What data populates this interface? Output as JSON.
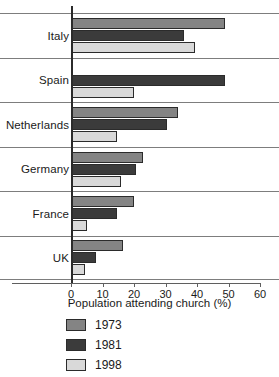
{
  "chart_data": {
    "type": "bar",
    "orientation": "horizontal",
    "title": "",
    "xlabel": "Population attending church (%)",
    "ylabel": "",
    "xlim": [
      0,
      60
    ],
    "xticks": [
      0,
      10,
      20,
      30,
      40,
      50,
      60
    ],
    "grid": false,
    "legend_position": "bottom-left",
    "categories": [
      "Italy",
      "Spain",
      "Netherlands",
      "Germany",
      "France",
      "UK"
    ],
    "series": [
      {
        "name": "1973",
        "color": "#848484",
        "values": [
          49,
          null,
          34,
          23,
          20,
          16.5
        ]
      },
      {
        "name": "1981",
        "color": "#3b3b3b",
        "values": [
          36,
          49,
          30.5,
          20.5,
          14.5,
          8
        ]
      },
      {
        "name": "1998",
        "color": "#d9d9d9",
        "values": [
          39.5,
          20,
          14.5,
          16,
          5,
          4.5
        ]
      }
    ]
  },
  "axis": {
    "title": "Population attending church (%)",
    "ticks": [
      "0",
      "10",
      "20",
      "30",
      "40",
      "50",
      "60"
    ]
  },
  "legend": {
    "items": [
      {
        "label": "1973"
      },
      {
        "label": "1981"
      },
      {
        "label": "1998"
      }
    ]
  },
  "categories": [
    {
      "label": "Italy"
    },
    {
      "label": "Spain"
    },
    {
      "label": "Netherlands"
    },
    {
      "label": "Germany"
    },
    {
      "label": "France"
    },
    {
      "label": "UK"
    }
  ]
}
